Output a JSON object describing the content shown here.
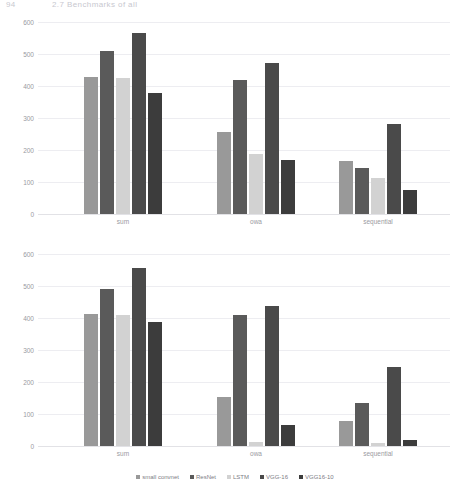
{
  "page_header": {
    "page_number": "94",
    "running_title": "2.7 Benchmarks of all"
  },
  "legend": {
    "position": "bottom-center",
    "items": [
      {
        "label": "small convnet",
        "color": "#999999"
      },
      {
        "label": "ResNet",
        "color": "#5a5a5a"
      },
      {
        "label": "LSTM",
        "color": "#d2d2d2"
      },
      {
        "label": "VGG-16",
        "color": "#4a4a4a"
      },
      {
        "label": "VGG16-10",
        "color": "#3c3c3c"
      }
    ]
  },
  "charts": [
    {
      "id": "chart-top",
      "yticks": [
        "600",
        "500",
        "400",
        "300",
        "200",
        "100",
        "0"
      ],
      "xcats": [
        "sum",
        "owa",
        "sequential"
      ]
    },
    {
      "id": "chart-bottom",
      "yticks": [
        "600",
        "500",
        "400",
        "300",
        "200",
        "100",
        "0"
      ],
      "xcats": [
        "sum",
        "owa",
        "sequential"
      ]
    }
  ],
  "chart_data": [
    {
      "type": "bar",
      "title": "",
      "subtitle": "",
      "xlabel": "",
      "ylabel": "",
      "categories": [
        "sum",
        "owa",
        "sequential"
      ],
      "series": [
        {
          "name": "small convnet",
          "color": "#999999",
          "values": [
            428,
            255,
            165
          ]
        },
        {
          "name": "ResNet",
          "color": "#5a5a5a",
          "values": [
            508,
            418,
            143
          ]
        },
        {
          "name": "LSTM",
          "color": "#d2d2d2",
          "values": [
            424,
            188,
            112
          ]
        },
        {
          "name": "VGG-16",
          "color": "#4a4a4a",
          "values": [
            567,
            473,
            280
          ]
        },
        {
          "name": "VGG16-10",
          "color": "#3c3c3c",
          "values": [
            378,
            168,
            75
          ]
        }
      ],
      "ylim": [
        0,
        600
      ],
      "yticks": [
        0,
        100,
        200,
        300,
        400,
        500,
        600
      ],
      "grid": true,
      "legend": "bottom"
    },
    {
      "type": "bar",
      "title": "",
      "subtitle": "",
      "xlabel": "",
      "ylabel": "",
      "categories": [
        "sum",
        "owa",
        "sequential"
      ],
      "series": [
        {
          "name": "small convnet",
          "color": "#999999",
          "values": [
            413,
            152,
            78
          ]
        },
        {
          "name": "ResNet",
          "color": "#5a5a5a",
          "values": [
            490,
            410,
            135
          ]
        },
        {
          "name": "LSTM",
          "color": "#d2d2d2",
          "values": [
            410,
            14,
            8
          ]
        },
        {
          "name": "VGG-16",
          "color": "#4a4a4a",
          "values": [
            557,
            438,
            248
          ]
        },
        {
          "name": "VGG16-10",
          "color": "#3c3c3c",
          "values": [
            388,
            65,
            18
          ]
        }
      ],
      "ylim": [
        0,
        600
      ],
      "yticks": [
        0,
        100,
        200,
        300,
        400,
        500,
        600
      ],
      "grid": true,
      "legend": "bottom"
    }
  ]
}
